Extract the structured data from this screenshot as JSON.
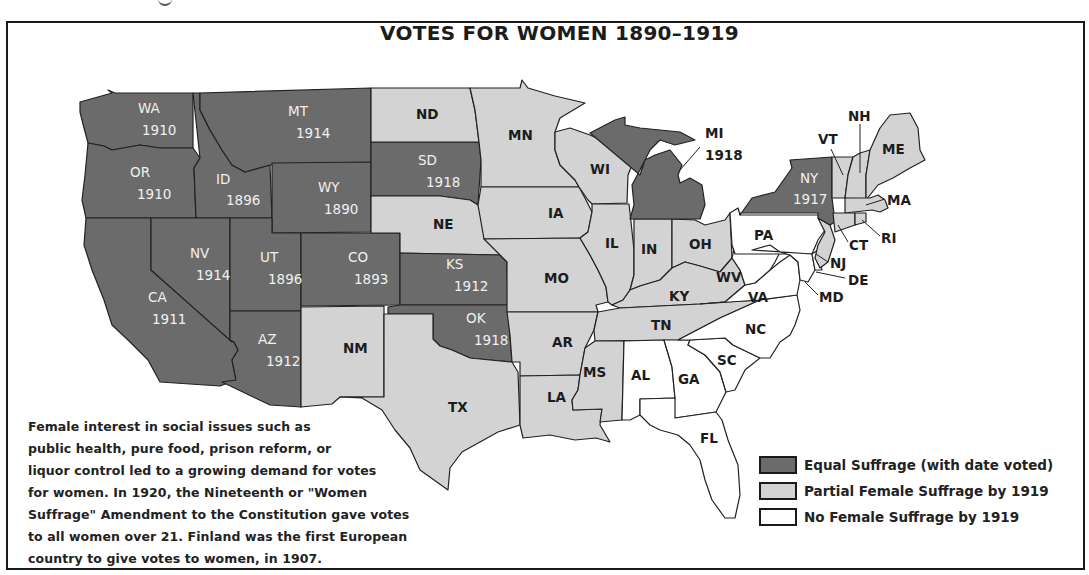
{
  "title": "VOTES FOR WOMEN  1890–1919",
  "note": "Female interest in social issues such as public health, pure food, prison reform, or liquor control led to a growing demand for votes for women. In 1920, the Nineteenth or \"Women Suffrage\" Amendment to the Constitution gave votes to all women over 21. Finland was the first European country to give votes to women, in 1907.",
  "note_lines": [
    "Female interest in social issues such as",
    "public health, pure food, prison reform, or",
    "liquor control led to a growing demand for votes",
    "for women. In 1920, the Nineteenth or \"Women",
    "Suffrage\" Amendment to the Constitution gave votes",
    "to all women over 21. Finland was the first European",
    "country to give votes to women, in 1907."
  ],
  "colors": {
    "equal": "#6b6b6b",
    "partial": "#d3d3d3",
    "none": "#ffffff",
    "border": "#222222"
  },
  "legend": [
    {
      "key": "equal",
      "label": "Equal Suffrage (with date voted)"
    },
    {
      "key": "partial",
      "label": "Partial Female Suffrage by 1919"
    },
    {
      "key": "none",
      "label": "No Female Suffrage by 1919"
    }
  ],
  "chart_data": {
    "type": "choropleth-map",
    "title": "VOTES FOR WOMEN  1890–1919",
    "categories": [
      "Equal Suffrage (with date voted)",
      "Partial Female Suffrage by 1919",
      "No Female Suffrage by 1919"
    ],
    "states": [
      {
        "abbr": "WA",
        "status": "equal",
        "year": 1910
      },
      {
        "abbr": "OR",
        "status": "equal",
        "year": 1910
      },
      {
        "abbr": "CA",
        "status": "equal",
        "year": 1911
      },
      {
        "abbr": "ID",
        "status": "equal",
        "year": 1896
      },
      {
        "abbr": "NV",
        "status": "equal",
        "year": 1914
      },
      {
        "abbr": "MT",
        "status": "equal",
        "year": 1914
      },
      {
        "abbr": "WY",
        "status": "equal",
        "year": 1890
      },
      {
        "abbr": "UT",
        "status": "equal",
        "year": 1896
      },
      {
        "abbr": "CO",
        "status": "equal",
        "year": 1893
      },
      {
        "abbr": "AZ",
        "status": "equal",
        "year": 1912
      },
      {
        "abbr": "SD",
        "status": "equal",
        "year": 1918
      },
      {
        "abbr": "KS",
        "status": "equal",
        "year": 1912
      },
      {
        "abbr": "OK",
        "status": "equal",
        "year": 1918
      },
      {
        "abbr": "MI",
        "status": "equal",
        "year": 1918
      },
      {
        "abbr": "NY",
        "status": "equal",
        "year": 1917
      },
      {
        "abbr": "ND",
        "status": "partial"
      },
      {
        "abbr": "NE",
        "status": "partial"
      },
      {
        "abbr": "NM",
        "status": "partial"
      },
      {
        "abbr": "TX",
        "status": "partial"
      },
      {
        "abbr": "MN",
        "status": "partial"
      },
      {
        "abbr": "IA",
        "status": "partial"
      },
      {
        "abbr": "MO",
        "status": "partial"
      },
      {
        "abbr": "AR",
        "status": "partial"
      },
      {
        "abbr": "LA",
        "status": "partial"
      },
      {
        "abbr": "WI",
        "status": "partial"
      },
      {
        "abbr": "IL",
        "status": "partial"
      },
      {
        "abbr": "IN",
        "status": "partial"
      },
      {
        "abbr": "OH",
        "status": "partial"
      },
      {
        "abbr": "KY",
        "status": "partial"
      },
      {
        "abbr": "TN",
        "status": "partial"
      },
      {
        "abbr": "MS",
        "status": "partial"
      },
      {
        "abbr": "VT",
        "status": "partial"
      },
      {
        "abbr": "NH",
        "status": "partial"
      },
      {
        "abbr": "ME",
        "status": "partial"
      },
      {
        "abbr": "MA",
        "status": "partial"
      },
      {
        "abbr": "RI",
        "status": "partial"
      },
      {
        "abbr": "CT",
        "status": "partial"
      },
      {
        "abbr": "NJ",
        "status": "partial"
      },
      {
        "abbr": "PA",
        "status": "none"
      },
      {
        "abbr": "WV",
        "status": "none"
      },
      {
        "abbr": "VA",
        "status": "none"
      },
      {
        "abbr": "MD",
        "status": "none"
      },
      {
        "abbr": "DE",
        "status": "none"
      },
      {
        "abbr": "NC",
        "status": "none"
      },
      {
        "abbr": "SC",
        "status": "none"
      },
      {
        "abbr": "GA",
        "status": "none"
      },
      {
        "abbr": "AL",
        "status": "none"
      },
      {
        "abbr": "FL",
        "status": "none"
      }
    ]
  },
  "shapes": [
    {
      "abbr": "WA",
      "status": "equal",
      "pts": "80,102 105,95 112,93 108,90 115,93 193,93 193,148 160,148 140,145 112,150 104,146 88,143 84,128 80,112"
    },
    {
      "abbr": "OR",
      "status": "equal",
      "pts": "88,143 104,146 112,150 140,145 160,148 193,148 200,158 194,168 196,218 86,218 82,200 85,175"
    },
    {
      "abbr": "CA",
      "status": "equal",
      "pts": "86,218 151,218 151,270 234,342 238,350 232,360 236,380 220,386 160,382 148,360 128,340 112,325 104,300 92,270 84,245"
    },
    {
      "abbr": "ID",
      "status": "equal",
      "pts": "193,93 200,93 200,110 210,130 222,150 232,165 245,172 270,165 272,218 196,218 194,168 200,158"
    },
    {
      "abbr": "NV",
      "status": "equal",
      "pts": "151,218 230,218 230,340 232,342 151,270"
    },
    {
      "abbr": "MT",
      "status": "equal",
      "pts": "200,93 371,88 371,163 272,165 270,165 245,172 232,165 222,150 210,130 200,110"
    },
    {
      "abbr": "WY",
      "status": "equal",
      "pts": "272,163 371,162 371,232 272,233"
    },
    {
      "abbr": "UT",
      "status": "equal",
      "pts": "230,218 272,218 272,233 301,233 301,311 230,311"
    },
    {
      "abbr": "CO",
      "status": "equal",
      "pts": "301,233 400,233 400,305 301,306"
    },
    {
      "abbr": "AZ",
      "status": "equal",
      "pts": "230,311 301,311 301,407 270,405 222,382 236,380 232,360 238,350 234,342 230,340"
    },
    {
      "abbr": "NM",
      "status": "equal_none",
      "pts": "301,307 384,306 384,397 340,397 332,404 301,407"
    },
    {
      "abbr": "SD",
      "status": "equal",
      "pts": "371,142 479,142 481,160 478,205 470,200 455,198 440,196 371,196"
    },
    {
      "abbr": "ND",
      "status": "partial",
      "pts": "371,88 470,88 475,110 479,142 371,142"
    },
    {
      "abbr": "NE",
      "status": "partial",
      "pts": "371,196 440,196 455,198 470,200 478,205 490,230 500,255 400,253 400,233 371,233"
    },
    {
      "abbr": "KS",
      "status": "equal",
      "pts": "400,253 500,255 507,262 508,305 400,305"
    },
    {
      "abbr": "OK",
      "status": "equal",
      "pts": "400,305 508,305 510,335 512,362 490,360 470,358 452,350 440,346 433,339 433,314 388,314 388,307"
    },
    {
      "abbr": "TX",
      "status": "partial",
      "pts": "388,314 433,314 433,339 440,346 452,350 470,358 490,360 512,362 518,372 520,425 498,432 462,452 450,468 448,490 420,470 410,448 395,430 382,410 362,398 340,397 384,397 384,314"
    },
    {
      "abbr": "MN",
      "status": "partial",
      "pts": "470,88 520,88 522,80 528,88 555,96 585,103 560,118 555,132 555,150 560,165 575,180 579,187 481,187 481,160 479,142 475,110"
    },
    {
      "abbr": "IA",
      "status": "partial",
      "pts": "481,187 579,187 586,200 592,212 588,232 580,238 484,239 478,205 481,187"
    },
    {
      "abbr": "MO",
      "status": "partial",
      "pts": "484,239 580,238 590,255 598,270 606,287 608,302 596,305 598,312 507,312 507,262 500,255"
    },
    {
      "abbr": "AR",
      "status": "partial",
      "pts": "507,312 598,312 594,330 585,348 580,375 520,376 520,362 512,362 510,335"
    },
    {
      "abbr": "LA",
      "status": "partial",
      "pts": "520,376 580,375 578,390 572,400 573,410 602,409 600,425 610,442 596,438 575,440 550,435 523,438 520,425"
    },
    {
      "abbr": "WI",
      "status": "partial",
      "pts": "555,132 570,128 590,135 605,142 625,150 632,165 628,175 627,203 592,204 588,200 579,187 575,180 560,165 555,150"
    },
    {
      "abbr": "IL",
      "status": "partial",
      "pts": "592,204 629,204 631,222 634,250 634,275 630,290 623,300 612,305 608,302 606,287 598,270 590,255 580,238 588,232 592,212"
    },
    {
      "abbr": "IN",
      "status": "partial",
      "pts": "634,219 672,219 672,268 660,280 640,286 630,290 634,275 634,250"
    },
    {
      "abbr": "OH",
      "status": "partial",
      "pts": "672,219 695,220 705,225 725,220 730,213 732,258 720,272 700,266 685,262 672,268"
    },
    {
      "abbr": "MI",
      "status": "equal",
      "pts": "590,133 615,120 625,117 625,125 640,128 680,132 695,140 675,145 660,140 650,150 640,170 632,185 634,205 630,219 672,219 700,219 705,205 702,185 690,178 680,183 678,175 682,165 670,150 655,155 645,160 640,175"
    },
    {
      "abbr": "KY",
      "status": "partial",
      "pts": "612,305 623,300 630,290 640,286 660,280 672,268 685,262 700,266 720,272 732,258 740,270 745,285 725,302 700,304 620,308"
    },
    {
      "abbr": "TN",
      "status": "partial",
      "pts": "598,312 620,308 700,304 725,302 760,300 720,318 678,340 595,341 594,330"
    },
    {
      "abbr": "MS",
      "status": "partial",
      "pts": "595,341 624,341 622,420 600,422 602,409 573,410 572,400 578,390 580,375 585,348"
    },
    {
      "abbr": "AL",
      "status": "none",
      "pts": "624,341 664,340 672,367 675,398 640,399 640,415 630,420 622,420"
    },
    {
      "abbr": "GA",
      "status": "none",
      "pts": "664,340 690,340 688,345 705,355 720,372 726,392 716,412 675,418 672,408 675,398 672,367"
    },
    {
      "abbr": "FL",
      "status": "none",
      "pts": "640,399 675,398 675,418 716,412 722,420 728,440 738,465 740,495 735,518 725,518 712,500 705,480 700,460 690,445 678,435 660,430 650,425 640,415"
    },
    {
      "abbr": "SC",
      "status": "none",
      "pts": "690,340 725,338 733,345 760,358 745,370 735,390 726,392 720,372 705,355 688,345"
    },
    {
      "abbr": "NC",
      "status": "none",
      "pts": "678,340 720,318 760,300 797,295 800,310 795,325 790,335 780,342 770,358 760,358 733,345 725,338 690,340"
    },
    {
      "abbr": "VA",
      "status": "none",
      "pts": "700,304 725,302 745,285 755,283 770,270 780,262 790,255 798,262 800,280 797,295 760,300"
    },
    {
      "abbr": "WV",
      "status": "none",
      "pts": "732,258 735,245 745,240 752,250 770,245 780,252 775,262 770,270 755,283 745,285 740,270"
    },
    {
      "abbr": "PA",
      "status": "none",
      "pts": "730,213 738,208 740,215 820,215 825,230 818,240 812,254 735,254 732,245"
    },
    {
      "abbr": "MD",
      "status": "none",
      "pts": "752,250 812,254 815,270 808,282 800,280 798,262 790,255 780,252 770,245"
    },
    {
      "abbr": "DE",
      "status": "none",
      "pts": "812,254 818,250 822,270 815,270"
    },
    {
      "abbr": "NJ",
      "status": "partial",
      "pts": "818,218 830,225 835,240 828,262 820,268 815,258 818,245 825,232"
    },
    {
      "abbr": "NY",
      "status": "equal",
      "pts": "740,215 752,198 775,192 785,178 792,168 790,160 832,157 832,198 835,222 830,225 818,218 818,213 740,213"
    },
    {
      "abbr": "VT",
      "status": "partial",
      "pts": "832,157 853,157 848,175 845,198 832,198"
    },
    {
      "abbr": "NH",
      "status": "partial",
      "pts": "853,157 860,153 870,150 866,175 866,200 845,198 848,175"
    },
    {
      "abbr": "ME",
      "status": "partial",
      "pts": "870,150 880,128 890,115 910,113 918,128 920,150 925,160 910,168 893,178 878,185 866,200 866,175"
    },
    {
      "abbr": "MA",
      "status": "partial",
      "pts": "845,198 870,198 878,195 885,200 888,208 880,212 872,210 845,213"
    },
    {
      "abbr": "CT",
      "status": "partial",
      "pts": "833,213 855,213 855,225 835,232"
    },
    {
      "abbr": "RI",
      "status": "partial",
      "pts": "855,213 866,213 866,222 855,225"
    }
  ],
  "labels": [
    {
      "text": "WA",
      "x": 138,
      "y": 113,
      "tone": "light"
    },
    {
      "text": "1910",
      "x": 142,
      "y": 135,
      "tone": "light"
    },
    {
      "text": "OR",
      "x": 130,
      "y": 177,
      "tone": "light"
    },
    {
      "text": "1910",
      "x": 137,
      "y": 199,
      "tone": "light"
    },
    {
      "text": "CA",
      "x": 148,
      "y": 302,
      "tone": "light"
    },
    {
      "text": "1911",
      "x": 152,
      "y": 324,
      "tone": "light"
    },
    {
      "text": "ID",
      "x": 216,
      "y": 184,
      "tone": "light"
    },
    {
      "text": "1896",
      "x": 226,
      "y": 205,
      "tone": "light"
    },
    {
      "text": "NV",
      "x": 190,
      "y": 258,
      "tone": "light"
    },
    {
      "text": "1914",
      "x": 196,
      "y": 280,
      "tone": "light"
    },
    {
      "text": "MT",
      "x": 288,
      "y": 116,
      "tone": "light"
    },
    {
      "text": "1914",
      "x": 296,
      "y": 138,
      "tone": "light"
    },
    {
      "text": "WY",
      "x": 318,
      "y": 192,
      "tone": "light"
    },
    {
      "text": "1890",
      "x": 324,
      "y": 214,
      "tone": "light"
    },
    {
      "text": "UT",
      "x": 260,
      "y": 262,
      "tone": "light"
    },
    {
      "text": "1896",
      "x": 268,
      "y": 284,
      "tone": "light"
    },
    {
      "text": "CO",
      "x": 348,
      "y": 262,
      "tone": "light"
    },
    {
      "text": "1893",
      "x": 354,
      "y": 284,
      "tone": "light"
    },
    {
      "text": "AZ",
      "x": 258,
      "y": 344,
      "tone": "light"
    },
    {
      "text": "1912",
      "x": 266,
      "y": 366,
      "tone": "light"
    },
    {
      "text": "SD",
      "x": 418,
      "y": 165,
      "tone": "light"
    },
    {
      "text": "1918",
      "x": 426,
      "y": 187,
      "tone": "light"
    },
    {
      "text": "KS",
      "x": 446,
      "y": 269,
      "tone": "light"
    },
    {
      "text": "1912",
      "x": 454,
      "y": 291,
      "tone": "light"
    },
    {
      "text": "OK",
      "x": 466,
      "y": 323,
      "tone": "light"
    },
    {
      "text": "1918",
      "x": 474,
      "y": 345,
      "tone": "light"
    },
    {
      "text": "NY",
      "x": 800,
      "y": 183,
      "tone": "light"
    },
    {
      "text": "1917",
      "x": 793,
      "y": 204,
      "tone": "light"
    },
    {
      "text": "ND",
      "x": 416,
      "y": 119,
      "tone": "dark"
    },
    {
      "text": "NE",
      "x": 433,
      "y": 229,
      "tone": "dark"
    },
    {
      "text": "NM",
      "x": 343,
      "y": 353,
      "tone": "dark"
    },
    {
      "text": "TX",
      "x": 448,
      "y": 412,
      "tone": "dark"
    },
    {
      "text": "MN",
      "x": 508,
      "y": 140,
      "tone": "dark"
    },
    {
      "text": "IA",
      "x": 548,
      "y": 218,
      "tone": "dark"
    },
    {
      "text": "MO",
      "x": 544,
      "y": 283,
      "tone": "dark"
    },
    {
      "text": "AR",
      "x": 552,
      "y": 347,
      "tone": "dark"
    },
    {
      "text": "LA",
      "x": 547,
      "y": 402,
      "tone": "dark"
    },
    {
      "text": "MS",
      "x": 583,
      "y": 377,
      "tone": "dark"
    },
    {
      "text": "WI",
      "x": 590,
      "y": 174,
      "tone": "dark"
    },
    {
      "text": "IL",
      "x": 605,
      "y": 248,
      "tone": "dark"
    },
    {
      "text": "IN",
      "x": 641,
      "y": 254,
      "tone": "dark"
    },
    {
      "text": "OH",
      "x": 689,
      "y": 249,
      "tone": "dark"
    },
    {
      "text": "KY",
      "x": 669,
      "y": 301,
      "tone": "dark"
    },
    {
      "text": "TN",
      "x": 651,
      "y": 330,
      "tone": "dark"
    },
    {
      "text": "AL",
      "x": 631,
      "y": 380,
      "tone": "dark"
    },
    {
      "text": "GA",
      "x": 678,
      "y": 384,
      "tone": "dark"
    },
    {
      "text": "FL",
      "x": 700,
      "y": 443,
      "tone": "dark"
    },
    {
      "text": "SC",
      "x": 717,
      "y": 365,
      "tone": "dark"
    },
    {
      "text": "NC",
      "x": 745,
      "y": 334,
      "tone": "dark"
    },
    {
      "text": "VA",
      "x": 748,
      "y": 302,
      "tone": "dark"
    },
    {
      "text": "WV",
      "x": 716,
      "y": 282,
      "tone": "dark"
    },
    {
      "text": "PA",
      "x": 754,
      "y": 240,
      "tone": "dark"
    },
    {
      "text": "MI",
      "x": 705,
      "y": 138,
      "tone": "dark"
    },
    {
      "text": "1918",
      "x": 705,
      "y": 160,
      "tone": "dark"
    },
    {
      "text": "VT",
      "x": 818,
      "y": 144,
      "tone": "dark"
    },
    {
      "text": "NH",
      "x": 848,
      "y": 121,
      "tone": "dark"
    },
    {
      "text": "ME",
      "x": 882,
      "y": 154,
      "tone": "dark"
    },
    {
      "text": "MA",
      "x": 887,
      "y": 205,
      "tone": "dark"
    },
    {
      "text": "RI",
      "x": 881,
      "y": 243,
      "tone": "dark"
    },
    {
      "text": "CT",
      "x": 849,
      "y": 250,
      "tone": "dark"
    },
    {
      "text": "NJ",
      "x": 830,
      "y": 268,
      "tone": "dark"
    },
    {
      "text": "DE",
      "x": 848,
      "y": 285,
      "tone": "dark"
    },
    {
      "text": "MD",
      "x": 819,
      "y": 302,
      "tone": "dark"
    }
  ],
  "leaders": [
    {
      "x1": 700,
      "y1": 147,
      "x2": 680,
      "y2": 170
    },
    {
      "x1": 831,
      "y1": 149,
      "x2": 843,
      "y2": 175
    },
    {
      "x1": 860,
      "y1": 124,
      "x2": 860,
      "y2": 173
    },
    {
      "x1": 885,
      "y1": 199,
      "x2": 866,
      "y2": 205
    },
    {
      "x1": 880,
      "y1": 236,
      "x2": 862,
      "y2": 220
    },
    {
      "x1": 848,
      "y1": 242,
      "x2": 838,
      "y2": 225
    },
    {
      "x1": 828,
      "y1": 262,
      "x2": 816,
      "y2": 254
    },
    {
      "x1": 845,
      "y1": 278,
      "x2": 816,
      "y2": 272
    },
    {
      "x1": 818,
      "y1": 295,
      "x2": 805,
      "y2": 282
    }
  ]
}
